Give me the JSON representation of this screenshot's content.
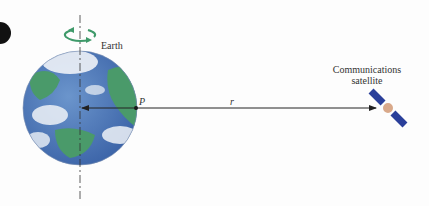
{
  "labels": {
    "earth": "Earth",
    "point": "P",
    "distance": "r",
    "satellite_line1": "Communications",
    "satellite_line2": "satellite"
  },
  "colors": {
    "ocean": "#4a78b8",
    "land": "#4a9a6a",
    "rotation_arrow": "#3f9a6a",
    "satellite_panel": "#2a3f9a",
    "satellite_body": "#d9a98a",
    "line": "#222222"
  }
}
